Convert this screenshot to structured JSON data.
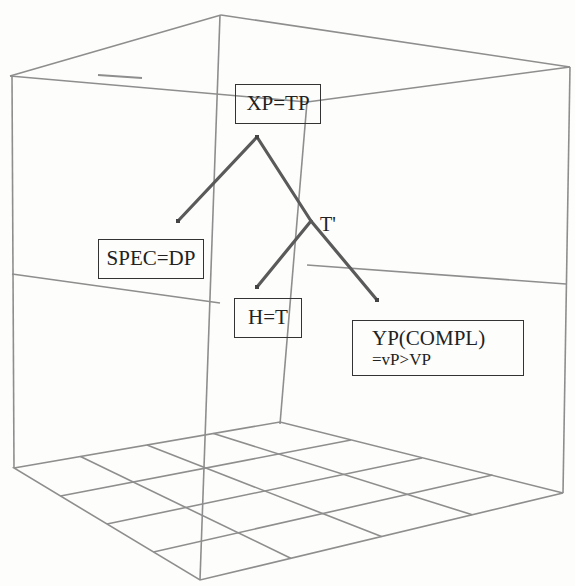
{
  "diagram": {
    "type": "syntax-tree-in-3d-box",
    "nodes": {
      "root": "XP=TP",
      "spec": "SPEC=DP",
      "bar": "T'",
      "head": "H=T",
      "compl_line1": "YP(COMPL)",
      "compl_line2": "=vP>VP"
    },
    "edges": [
      [
        "XP=TP",
        "SPEC=DP"
      ],
      [
        "XP=TP",
        "T'"
      ],
      [
        "T'",
        "H=T"
      ],
      [
        "T'",
        "YP(COMPL)=vP>VP"
      ]
    ],
    "colors": {
      "box_lines": "#8a8a8a",
      "tree_branches": "#555555",
      "node_border": "#333333",
      "background": "#fdfdfb"
    }
  }
}
